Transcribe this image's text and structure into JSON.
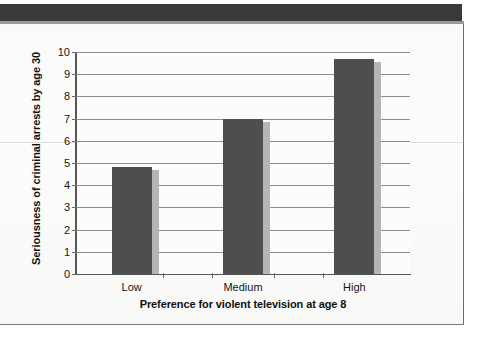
{
  "figure": {
    "background_color": "#fbfbfa",
    "frame_color": "#6d6d6d",
    "top_band_color": "#3a3a3a",
    "bar_color": "#4e4e4e",
    "bar_shadow_color": "#b5b5b5",
    "gridline_color": "#8e8e8e",
    "axis_color": "#575757"
  },
  "chart_data": {
    "type": "bar",
    "title": "",
    "xlabel": "Preference for violent television at age 8",
    "ylabel": "Seriousness of criminal arrests by age 30",
    "categories": [
      "Low",
      "Medium",
      "High"
    ],
    "values": [
      4.8,
      7.0,
      9.7
    ],
    "series": [
      {
        "name": "Seriousness of criminal arrests by age 30",
        "values": [
          4.8,
          7.0,
          9.7
        ]
      }
    ],
    "ylim": [
      0,
      10
    ],
    "ytick_labels": [
      "0",
      "1",
      "2",
      "3",
      "4",
      "5",
      "6",
      "7",
      "8",
      "9",
      "10"
    ],
    "ytick_values": [
      0,
      1,
      2,
      3,
      4,
      5,
      6,
      7,
      8,
      9,
      10
    ],
    "xtick_labels": [
      "Low",
      "Medium",
      "High"
    ],
    "grid": true,
    "grid_axis": "y",
    "legend": false,
    "legend_position": "none",
    "bar_color": "#4e4e4e",
    "annotations": []
  }
}
